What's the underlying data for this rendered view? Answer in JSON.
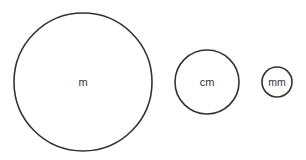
{
  "diagram": {
    "units": [
      {
        "id": "meter",
        "label": "m",
        "relative_size": "large"
      },
      {
        "id": "centimeter",
        "label": "cm",
        "relative_size": "medium"
      },
      {
        "id": "millimeter",
        "label": "mm",
        "relative_size": "small"
      }
    ],
    "colors": {
      "stroke": "#333333",
      "background": "#ffffff"
    }
  }
}
